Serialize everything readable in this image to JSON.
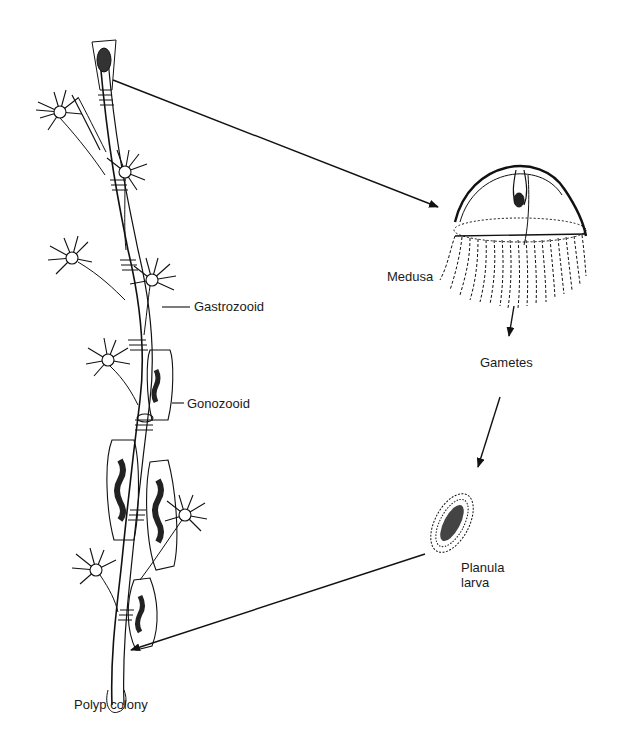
{
  "labels": {
    "gastrozooid": "Gastrozooid",
    "gonozooid": "Gonozooid",
    "medusa": "Medusa",
    "gametes": "Gametes",
    "planula_line1": "Planula",
    "planula_line2": "larva",
    "polyp_colony": "Polyp colony"
  },
  "cycle_stages": [
    "Polyp colony",
    "Medusa",
    "Gametes",
    "Planula larva"
  ],
  "arrows": [
    {
      "from": "Polyp colony (gonozooid)",
      "to": "Medusa"
    },
    {
      "from": "Medusa",
      "to": "Gametes"
    },
    {
      "from": "Gametes",
      "to": "Planula larva"
    },
    {
      "from": "Planula larva",
      "to": "Polyp colony"
    }
  ],
  "colors": {
    "ink": "#111111",
    "background": "#ffffff"
  }
}
